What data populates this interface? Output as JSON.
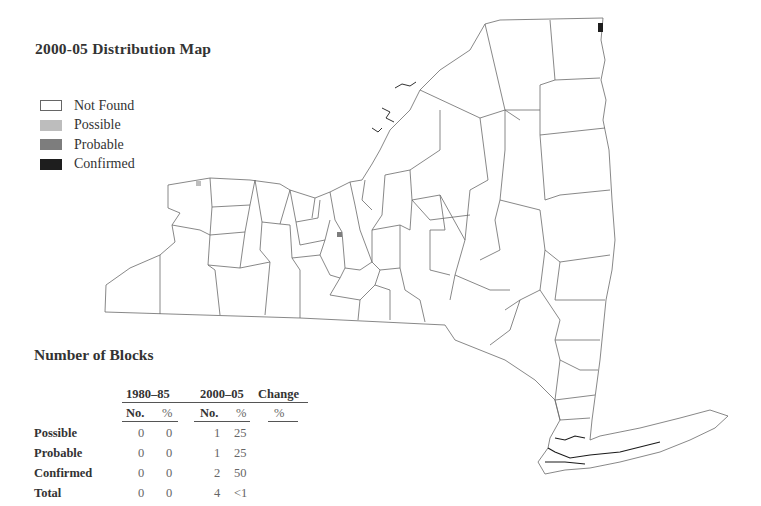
{
  "map": {
    "title": "2000-05 Distribution Map",
    "legend": [
      {
        "label": "Not Found",
        "fill": "#ffffff",
        "stroke": "#666666"
      },
      {
        "label": "Possible",
        "fill": "#bdbdbd",
        "stroke": "#bdbdbd"
      },
      {
        "label": "Probable",
        "fill": "#7d7d7d",
        "stroke": "#7d7d7d"
      },
      {
        "label": "Confirmed",
        "fill": "#1e1e1e",
        "stroke": "#1e1e1e"
      }
    ],
    "markers": [
      {
        "status": "Possible",
        "x": 198,
        "y": 183
      },
      {
        "status": "Probable",
        "x": 339,
        "y": 234
      },
      {
        "status": "Confirmed",
        "x": 600,
        "y": 27
      }
    ]
  },
  "blocks": {
    "title": "Number of Blocks",
    "period_headers": [
      "1980–85",
      "2000–05",
      "Change"
    ],
    "sub_headers": [
      "No.",
      "%",
      "No.",
      "%",
      "%"
    ],
    "rows": [
      {
        "label": "Possible",
        "p1_no": "0",
        "p1_pct": "0",
        "p2_no": "1",
        "p2_pct": "25",
        "change": ""
      },
      {
        "label": "Probable",
        "p1_no": "0",
        "p1_pct": "0",
        "p2_no": "1",
        "p2_pct": "25",
        "change": ""
      },
      {
        "label": "Confirmed",
        "p1_no": "0",
        "p1_pct": "0",
        "p2_no": "2",
        "p2_pct": "50",
        "change": ""
      },
      {
        "label": "Total",
        "p1_no": "0",
        "p1_pct": "0",
        "p2_no": "4",
        "p2_pct": "<1",
        "change": ""
      }
    ]
  }
}
